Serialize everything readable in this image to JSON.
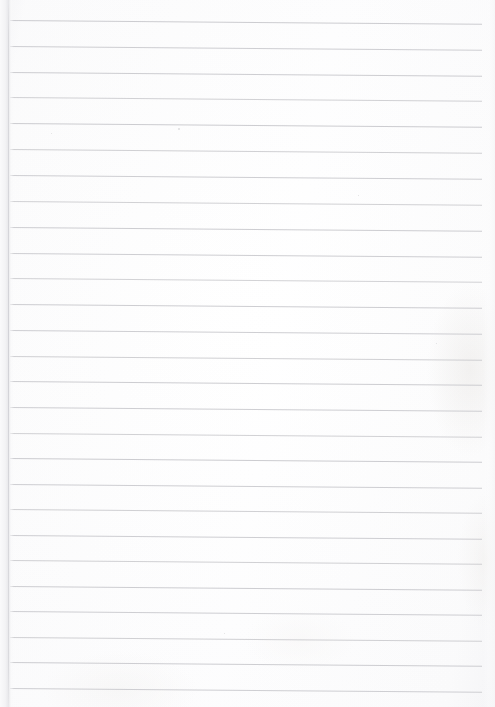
{
  "document": {
    "kind": "scanned-ruled-paper",
    "title": "Blank ruled notebook page",
    "page_width": 495,
    "page_height": 707,
    "content_text": "",
    "has_handwriting": false,
    "has_printed_text": false
  },
  "colors": {
    "paper_background": "#fdfdfd",
    "rule_line": "#c9c9cd",
    "rule_line_faint": "#dcdce0",
    "left_edge_shadow": "#e7e7ea",
    "page_border": "#f2f2f3"
  },
  "ruling": {
    "style": "wide-ruled horizontal lines",
    "line_count": 27,
    "line_spacing_px": 25.7,
    "first_line_y": 20,
    "line_left_x": 10,
    "line_right_x": 482,
    "tilt_degrees": 0.45,
    "lines": [
      {
        "index": 1,
        "y": 20,
        "x1": 10,
        "x2": 482,
        "opacity": 0.95
      },
      {
        "index": 2,
        "y": 46,
        "x1": 10,
        "x2": 482,
        "opacity": 0.9
      },
      {
        "index": 3,
        "y": 72,
        "x1": 10,
        "x2": 482,
        "opacity": 0.92
      },
      {
        "index": 4,
        "y": 97,
        "x1": 10,
        "x2": 482,
        "opacity": 0.85
      },
      {
        "index": 5,
        "y": 123,
        "x1": 10,
        "x2": 482,
        "opacity": 0.95
      },
      {
        "index": 6,
        "y": 149,
        "x1": 10,
        "x2": 482,
        "opacity": 0.88
      },
      {
        "index": 7,
        "y": 175,
        "x1": 10,
        "x2": 482,
        "opacity": 0.9
      },
      {
        "index": 8,
        "y": 201,
        "x1": 10,
        "x2": 482,
        "opacity": 0.86
      },
      {
        "index": 9,
        "y": 227,
        "x1": 10,
        "x2": 482,
        "opacity": 0.92
      },
      {
        "index": 10,
        "y": 253,
        "x1": 10,
        "x2": 482,
        "opacity": 0.9
      },
      {
        "index": 11,
        "y": 278,
        "x1": 10,
        "x2": 482,
        "opacity": 0.84
      },
      {
        "index": 12,
        "y": 304,
        "x1": 10,
        "x2": 482,
        "opacity": 0.93
      },
      {
        "index": 13,
        "y": 330,
        "x1": 10,
        "x2": 482,
        "opacity": 0.9
      },
      {
        "index": 14,
        "y": 356,
        "x1": 10,
        "x2": 482,
        "opacity": 0.88
      },
      {
        "index": 15,
        "y": 381,
        "x1": 10,
        "x2": 482,
        "opacity": 0.92
      },
      {
        "index": 16,
        "y": 407,
        "x1": 10,
        "x2": 482,
        "opacity": 0.9
      },
      {
        "index": 17,
        "y": 433,
        "x1": 10,
        "x2": 482,
        "opacity": 0.86
      },
      {
        "index": 18,
        "y": 458,
        "x1": 10,
        "x2": 482,
        "opacity": 0.94
      },
      {
        "index": 19,
        "y": 484,
        "x1": 10,
        "x2": 482,
        "opacity": 0.9
      },
      {
        "index": 20,
        "y": 509,
        "x1": 10,
        "x2": 482,
        "opacity": 0.88
      },
      {
        "index": 21,
        "y": 535,
        "x1": 10,
        "x2": 482,
        "opacity": 0.9
      },
      {
        "index": 22,
        "y": 560,
        "x1": 10,
        "x2": 482,
        "opacity": 0.87
      },
      {
        "index": 23,
        "y": 586,
        "x1": 10,
        "x2": 482,
        "opacity": 0.93
      },
      {
        "index": 24,
        "y": 611,
        "x1": 10,
        "x2": 482,
        "opacity": 0.9
      },
      {
        "index": 25,
        "y": 637,
        "x1": 10,
        "x2": 482,
        "opacity": 0.88
      },
      {
        "index": 26,
        "y": 662,
        "x1": 10,
        "x2": 482,
        "opacity": 0.92
      },
      {
        "index": 27,
        "y": 688,
        "x1": 10,
        "x2": 482,
        "opacity": 0.9
      }
    ]
  },
  "artifacts": {
    "specks": [
      {
        "x": 178,
        "y": 128,
        "size": 2
      },
      {
        "x": 358,
        "y": 195,
        "size": 1
      },
      {
        "x": 51,
        "y": 133,
        "size": 1
      },
      {
        "x": 436,
        "y": 343,
        "size": 1
      },
      {
        "x": 224,
        "y": 633,
        "size": 1
      }
    ]
  }
}
